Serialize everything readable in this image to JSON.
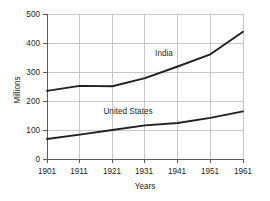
{
  "chart_data": {
    "type": "line",
    "title": "",
    "xlabel": "Years",
    "ylabel": "Millions",
    "x": [
      1901,
      1911,
      1921,
      1931,
      1941,
      1951,
      1961
    ],
    "xticklabels": [
      "1901",
      "1911",
      "1921",
      "1931",
      "1941",
      "1951",
      "1961"
    ],
    "xlim": [
      1901,
      1961
    ],
    "ylim": [
      0,
      500
    ],
    "yticks": [
      0,
      100,
      200,
      300,
      400,
      500
    ],
    "yticklabels": [
      "0",
      "100",
      "200",
      "300",
      "400",
      "500"
    ],
    "grid": "both",
    "legend": "inline-labels",
    "series": [
      {
        "name": "India",
        "label": "India",
        "values": [
          235,
          252,
          251,
          279,
          319,
          361,
          439
        ],
        "color": "#231f20"
      },
      {
        "name": "United States",
        "label": "United States",
        "values": [
          69,
          84,
          100,
          116,
          124,
          142,
          164
        ],
        "color": "#231f20"
      }
    ],
    "annotations": [
      {
        "text": "India",
        "x": 1937,
        "y": 330
      },
      {
        "text": "United States",
        "x": 1926,
        "y": 163
      }
    ],
    "colors": {
      "line": "#231f20",
      "grid": "#b9b9b9",
      "axis": "#5b5b5b",
      "background": "#ffffff",
      "text": "#231f20"
    }
  }
}
